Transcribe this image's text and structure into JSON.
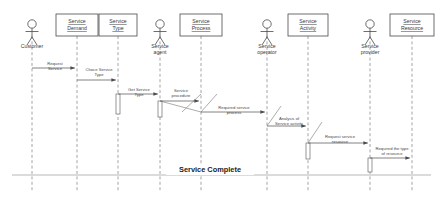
{
  "diagram": {
    "type": "uml-sequence-diagram",
    "canvas": {
      "width": 443,
      "height": 201
    },
    "colors": {
      "background": "#ffffff",
      "stroke": "#4a4a4a",
      "lifeline": "#8d8d8d",
      "message": "#5a5a5a",
      "text": "#3a3a3a"
    }
  },
  "participants": [
    {
      "id": "customer",
      "label": "Customer",
      "kind": "actor",
      "x": 32,
      "head_y": 24,
      "label_y": 48
    },
    {
      "id": "service-demand",
      "label": "Service Demand",
      "kind": "object",
      "x": 77,
      "box_y": 14,
      "box_w": 42,
      "box_h": 22
    },
    {
      "id": "service-type",
      "label": "Service Type",
      "kind": "object",
      "x": 118,
      "box_y": 14,
      "box_w": 38,
      "box_h": 22
    },
    {
      "id": "service-agent",
      "label": "Service agent",
      "kind": "actor",
      "x": 160,
      "head_y": 24,
      "label_y": 48
    },
    {
      "id": "service-process",
      "label": "Service Process",
      "kind": "object",
      "x": 201,
      "box_y": 14,
      "box_w": 42,
      "box_h": 22
    },
    {
      "id": "service-operator",
      "label": "Service operator",
      "kind": "actor",
      "x": 267,
      "head_y": 24,
      "label_y": 48
    },
    {
      "id": "service-activity",
      "label": "Service Activity",
      "kind": "object",
      "x": 308,
      "box_y": 14,
      "box_w": 40,
      "box_h": 22
    },
    {
      "id": "service-provider",
      "label": "Service provider",
      "kind": "actor",
      "x": 370,
      "head_y": 24,
      "label_y": 48
    },
    {
      "id": "service-resource",
      "label": "Service Resource",
      "kind": "object",
      "x": 412,
      "box_y": 14,
      "box_w": 44,
      "box_h": 22
    }
  ],
  "messages": [
    {
      "id": "m1",
      "label": "Request Service",
      "from_x": 32,
      "to_x": 77,
      "y": 68,
      "label_x": 55,
      "label_y": 65
    },
    {
      "id": "m2",
      "label": "Choce Service Type",
      "from_x": 77,
      "to_x": 118,
      "y": 80,
      "label_x": 99,
      "label_y": 71
    },
    {
      "id": "m3",
      "label": "Get Service Type",
      "from_x": 118,
      "to_x": 160,
      "y": 94,
      "label_x": 139,
      "label_y": 91
    },
    {
      "id": "m4",
      "label": "Service procedure",
      "from_x": 160,
      "to_x": 201,
      "y": 101,
      "label_x": 181,
      "label_y": 92
    },
    {
      "id": "m5",
      "label": "Required service process",
      "from_x": 201,
      "to_x": 267,
      "y": 112,
      "label_x": 234,
      "label_y": 109
    },
    {
      "id": "m6",
      "label": "Analysis of Service activity",
      "from_x": 267,
      "to_x": 308,
      "y": 126,
      "label_x": 289,
      "label_y": 120
    },
    {
      "id": "m7",
      "label": "Request service resource",
      "from_x": 308,
      "to_x": 370,
      "y": 143,
      "label_x": 340,
      "label_y": 138
    },
    {
      "id": "m8",
      "label": "Required the type of resource",
      "from_x": 370,
      "to_x": 412,
      "y": 158,
      "label_x": 392,
      "label_y": 150
    }
  ],
  "return_lines": [
    {
      "id": "r1",
      "from_x": 201,
      "from_y": 94,
      "to_x": 182,
      "to_y": 112
    },
    {
      "id": "r2",
      "from_x": 217,
      "from_y": 94,
      "to_x": 201,
      "to_y": 112
    },
    {
      "id": "r3",
      "from_x": 281,
      "from_y": 106,
      "to_x": 267,
      "to_y": 126
    },
    {
      "id": "r4",
      "from_x": 322,
      "from_y": 122,
      "to_x": 308,
      "to_y": 143
    },
    {
      "id": "r5",
      "from_x": 160,
      "from_y": 101,
      "to_x": 201,
      "to_y": 112
    }
  ],
  "activations": [
    {
      "id": "a1",
      "x": 118,
      "y": 94,
      "w": 4,
      "h": 20
    },
    {
      "id": "a2",
      "x": 160,
      "y": 101,
      "w": 4,
      "h": 16
    },
    {
      "id": "a3",
      "x": 308,
      "y": 143,
      "w": 4,
      "h": 16
    },
    {
      "id": "a4",
      "x": 370,
      "y": 158,
      "w": 4,
      "h": 14
    }
  ],
  "footer": {
    "complete_label": "Service Complete",
    "complete_label_x": 210,
    "complete_label_y": 172,
    "line_y": 175
  },
  "lifelines": {
    "top_y": 36,
    "bottom_y": 192
  }
}
